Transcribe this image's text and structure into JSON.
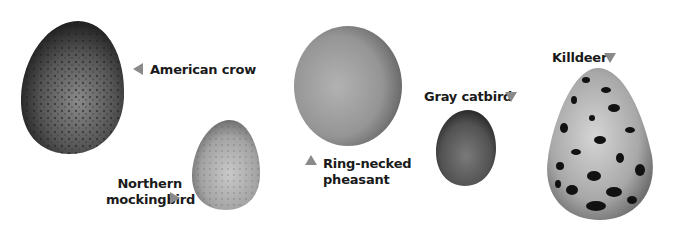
{
  "eggs": [
    {
      "name": "American crow",
      "arrow": "left",
      "tone": "dark speckled"
    },
    {
      "name_lines": [
        "Northern",
        "mockingbird"
      ],
      "arrow": "right",
      "tone": "light speckled"
    },
    {
      "name_lines": [
        "Ring-necked",
        "pheasant"
      ],
      "arrow": "up",
      "tone": "plain"
    },
    {
      "name": "Gray catbird",
      "arrow": "down",
      "tone": "dark plain"
    },
    {
      "name": "Killdeer",
      "arrow": "down",
      "tone": "blotched"
    }
  ],
  "colors": {
    "arrow": "#8a8a8a",
    "label": "#1a1a1a"
  }
}
